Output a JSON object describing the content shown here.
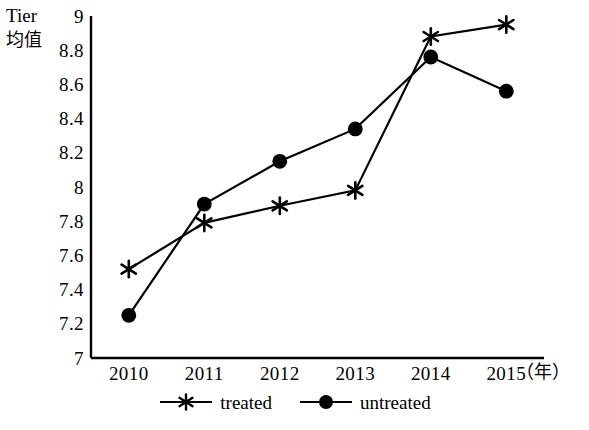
{
  "chart_data": {
    "type": "line",
    "title": "",
    "subtitle": "",
    "xlabel": "（年）",
    "ylabel_line1": "Tier",
    "ylabel_line2": "均值",
    "categories": [
      "2010",
      "2011",
      "2012",
      "2013",
      "2014",
      "2015"
    ],
    "x": [
      2010,
      2011,
      2012,
      2013,
      2014,
      2015
    ],
    "series": [
      {
        "name": "treated",
        "marker": "asterisk",
        "color": "#000000",
        "values": [
          7.52,
          7.79,
          7.89,
          7.98,
          8.88,
          8.95
        ]
      },
      {
        "name": "untreated",
        "marker": "filled-circle",
        "color": "#000000",
        "values": [
          7.25,
          7.9,
          8.15,
          8.34,
          8.76,
          8.56
        ]
      }
    ],
    "ylim": [
      7,
      9
    ],
    "ytick_step": 0.2,
    "ytick_labels": [
      "9",
      "8.8",
      "8.6",
      "8.4",
      "8.2",
      "8",
      "7.8",
      "7.6",
      "7.4",
      "7.2",
      "7"
    ],
    "ytick_values": [
      9,
      8.8,
      8.6,
      8.4,
      8.2,
      8,
      7.8,
      7.6,
      7.4,
      7.2,
      7
    ],
    "grid": false,
    "legend_position": "bottom-center",
    "axis_style": "left-and-bottom-spines"
  },
  "legend": {
    "entries": [
      {
        "label": "treated",
        "marker": "asterisk-marker-icon"
      },
      {
        "label": "untreated",
        "marker": "circle-marker-icon"
      }
    ]
  }
}
